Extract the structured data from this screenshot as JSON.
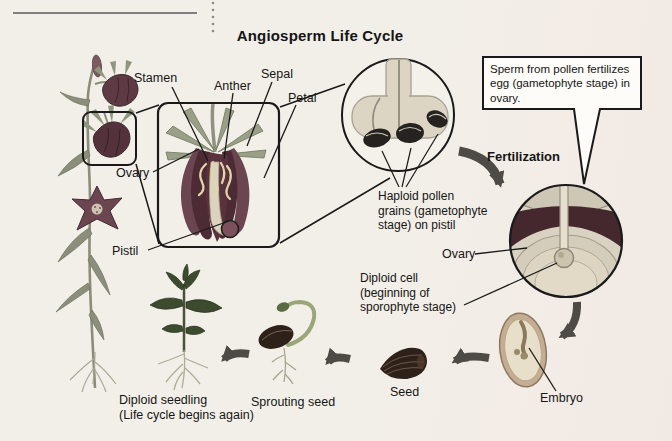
{
  "title": "Angiosperm Life Cycle",
  "flower_labels": {
    "stamen": "Stamen",
    "anther": "Anther",
    "sepal": "Sepal",
    "petal": "Petal",
    "ovary": "Ovary",
    "pistil": "Pistil"
  },
  "callout": {
    "lines": [
      "Sperm from pollen fertilizes",
      "egg (gametophyte stage) in",
      "ovary."
    ]
  },
  "stages": {
    "fertilization": "Fertilization",
    "haploid_lines": [
      "Haploid pollen",
      "grains (gametophyte",
      "stage) on pistil"
    ],
    "ovary": "Ovary",
    "diploid_cell_lines": [
      "Diploid cell",
      "(beginning of",
      "sporophyte stage)"
    ],
    "embryo": "Embryo",
    "seed": "Seed",
    "sprouting_seed": "Sprouting seed",
    "seedling_lines": [
      "Diploid seedling",
      "(Life cycle begins again)"
    ]
  },
  "colors": {
    "background": "#f2efe8",
    "ink": "#1a1a1a",
    "arrow": "#4e4a45",
    "flower_petal": "#4c2b35",
    "sepal_green": "#9aa087",
    "ovary_dark": "#45272e",
    "tissue_light": "#ded7c7",
    "seed_brown": "#2e211a",
    "callout_bg": "#fdfcf8"
  }
}
